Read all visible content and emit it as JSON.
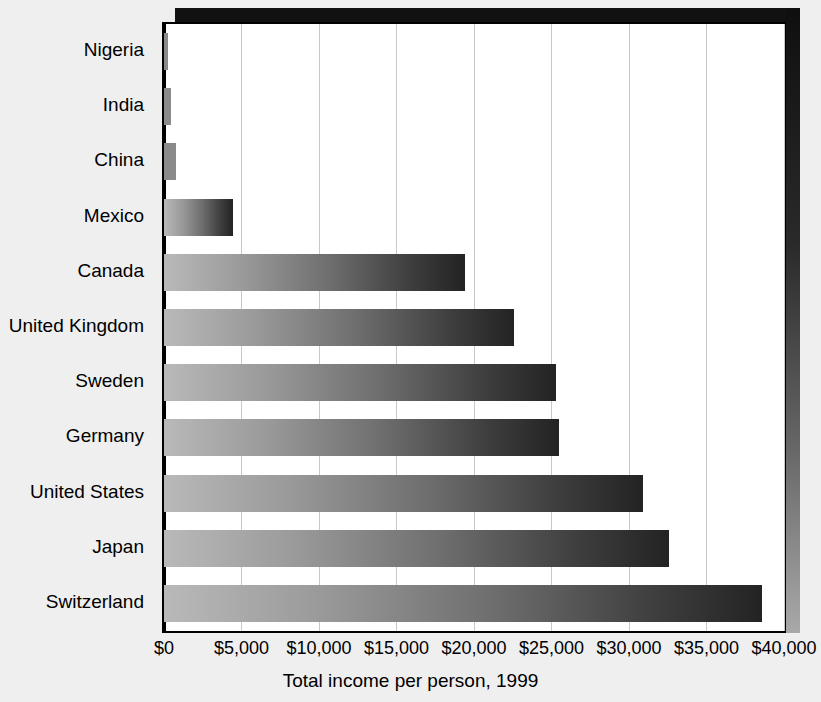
{
  "chart_data": {
    "type": "bar",
    "orientation": "horizontal",
    "title": "",
    "xlabel": "Total income per person, 1999",
    "ylabel": "",
    "categories": [
      "Nigeria",
      "India",
      "China",
      "Mexico",
      "Canada",
      "United Kingdom",
      "Sweden",
      "Germany",
      "United States",
      "Japan",
      "Switzerland"
    ],
    "values": [
      250,
      450,
      780,
      4450,
      19400,
      22600,
      25300,
      25500,
      30900,
      32600,
      38600
    ],
    "value_prefix": "$",
    "xlim": [
      0,
      40000
    ],
    "xticks": [
      0,
      5000,
      10000,
      15000,
      20000,
      25000,
      30000,
      35000,
      40000
    ],
    "xtick_labels": [
      "$0",
      "$5,000",
      "$10,000",
      "$15,000",
      "$20,000",
      "$25,000",
      "$30,000",
      "$35,000",
      "$40,000"
    ],
    "grid": true,
    "grid_axis": "x",
    "legend": false,
    "legend_position": "none",
    "colors": {
      "background": "#efefef",
      "plot_background": "#ffffff",
      "bar_gradient_start": "#b9b9b9",
      "bar_gradient_end": "#232323",
      "gridline": "#c8c8c8",
      "axis": "#000000",
      "shadow": "#111111",
      "text": "#000000"
    }
  }
}
